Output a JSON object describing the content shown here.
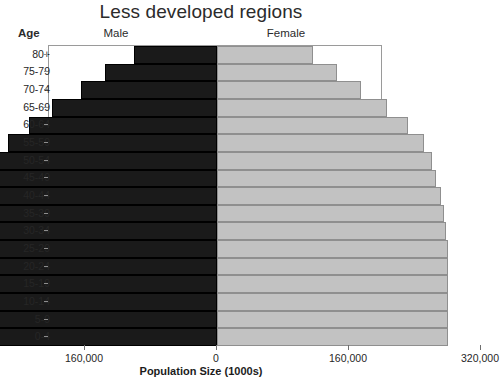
{
  "chart_data": {
    "type": "bar",
    "subtype": "population-pyramid",
    "title": "Less developed regions",
    "xlabel": "Population Size (1000s)",
    "ylabel": "Age",
    "xlim": [
      -320000,
      320000
    ],
    "xticks": [
      -320000,
      -160000,
      0,
      160000,
      320000
    ],
    "xtick_labels": [
      "320,000",
      "160,000",
      "0",
      "160,000",
      "320,000"
    ],
    "grid": false,
    "legend": [
      "Male",
      "Female"
    ],
    "legend_position": "top",
    "categories": [
      "80+",
      "75-79",
      "70-74",
      "65-69",
      "60-64",
      "55-59",
      "50-54",
      "45-49",
      "40-44",
      "35-39",
      "30-34",
      "25-29",
      "20-24",
      "15-19",
      "10-14",
      "5-9",
      "0-4"
    ],
    "series": [
      {
        "name": "Male",
        "color": "#1a1a1a",
        "values": [
          101000,
          136000,
          165000,
          200000,
          228000,
          253000,
          268000,
          278000,
          286000,
          292000,
          296000,
          300000,
          300000,
          300000,
          300000,
          300000,
          300000
        ]
      },
      {
        "name": "Female",
        "color": "#c2c2c2",
        "values": [
          116000,
          146000,
          175000,
          206000,
          232000,
          251000,
          260000,
          266000,
          271000,
          275000,
          277000,
          280000,
          280000,
          280000,
          280000,
          280000,
          280000
        ]
      }
    ]
  },
  "header": {
    "age_label": "Age",
    "male_label": "Male",
    "female_label": "Female"
  }
}
